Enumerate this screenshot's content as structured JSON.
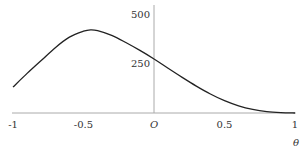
{
  "chart_data": {
    "type": "line",
    "title": "",
    "xlabel": "θ",
    "ylabel": "",
    "xlim": [
      -1,
      1
    ],
    "ylim": [
      0,
      500
    ],
    "grid": false,
    "legend": null,
    "x_ticks": [
      "-1",
      "-0.5",
      "O",
      "0.5",
      "1"
    ],
    "y_ticks": [
      "250",
      "500"
    ],
    "series": [
      {
        "name": "curve",
        "x": [
          -1.0,
          -0.9,
          -0.8,
          -0.7,
          -0.6,
          -0.5,
          -0.45,
          -0.4,
          -0.3,
          -0.2,
          -0.1,
          0.0,
          0.1,
          0.2,
          0.3,
          0.4,
          0.5,
          0.6,
          0.7,
          0.8,
          0.9,
          1.0
        ],
        "values": [
          131,
          200,
          265,
          330,
          383,
          413,
          420,
          416,
          392,
          356,
          316,
          273,
          226,
          180,
          136,
          96,
          62,
          36,
          18,
          7,
          2,
          0
        ]
      }
    ]
  }
}
